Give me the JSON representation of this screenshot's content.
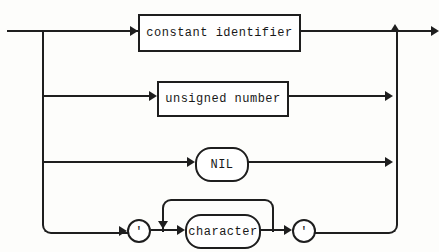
{
  "diagram": {
    "kind": "railroad-syntax-diagram",
    "background_color": "#fdfdfb",
    "line_color": "#1e1e1e",
    "branches": [
      {
        "type": "box",
        "label": "constant identifier"
      },
      {
        "type": "box",
        "label": "unsigned number"
      },
      {
        "type": "stadium",
        "label": "NIL"
      },
      {
        "type": "quoted-loop",
        "open_quote": "'",
        "label": "character",
        "close_quote": "'"
      }
    ]
  }
}
